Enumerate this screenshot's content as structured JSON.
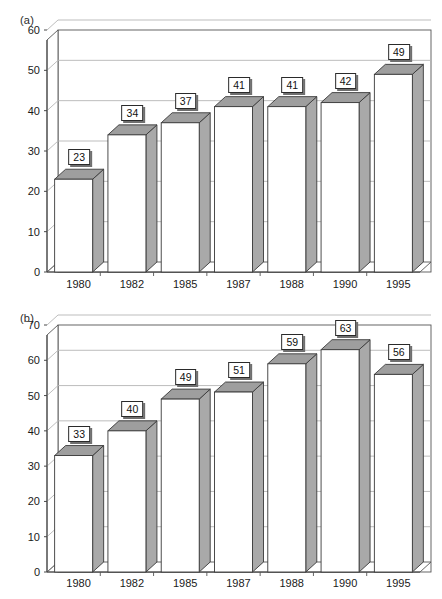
{
  "figure": {
    "background": "#ffffff",
    "bar_front_color": "#ffffff",
    "bar_side_color": "#a9a9a9",
    "bar_top_color": "#9e9e9e",
    "bar_outline_color": "#3a3a3a",
    "gridline_color": "#b5b5b5",
    "axis_color": "#555555",
    "label_box_background": "#ffffff",
    "label_box_border": "#2a2a2a",
    "label_box_shadow": "#6f6f6f"
  },
  "panels": [
    {
      "id": "a",
      "panel_label": "(a)",
      "chart_data": {
        "type": "bar",
        "title": "(a)",
        "xlabel": "",
        "ylabel": "",
        "categories": [
          "1980",
          "1982",
          "1985",
          "1987",
          "1988",
          "1990",
          "1995"
        ],
        "values": [
          23,
          34,
          37,
          41,
          41,
          42,
          49
        ],
        "data_labels": [
          "23",
          "34",
          "37",
          "41",
          "41",
          "42",
          "49"
        ],
        "ylim": [
          0,
          60
        ],
        "ytick_step": 10,
        "yticks": [
          "0",
          "10",
          "20",
          "30",
          "40",
          "50",
          "60"
        ],
        "grid": true,
        "legend": "none",
        "projection": "3d"
      }
    },
    {
      "id": "b",
      "panel_label": "(b)",
      "chart_data": {
        "type": "bar",
        "title": "(b)",
        "xlabel": "",
        "ylabel": "",
        "categories": [
          "1980",
          "1982",
          "1985",
          "1987",
          "1988",
          "1990",
          "1995"
        ],
        "values": [
          33,
          40,
          49,
          51,
          59,
          63,
          56
        ],
        "data_labels": [
          "33",
          "40",
          "49",
          "51",
          "59",
          "63",
          "56"
        ],
        "ylim": [
          0,
          70
        ],
        "ytick_step": 10,
        "yticks": [
          "0",
          "10",
          "20",
          "30",
          "40",
          "50",
          "60",
          "70"
        ],
        "grid": true,
        "legend": "none",
        "projection": "3d"
      }
    }
  ]
}
